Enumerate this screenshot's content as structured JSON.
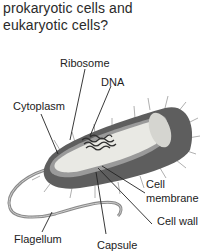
{
  "question": {
    "line1": "prokaryotic cells and",
    "line2": "eukaryotic cells?"
  },
  "diagram": {
    "labels": {
      "ribosome": "Ribosome",
      "dna": "DNA",
      "cytoplasm": "Cytoplasm",
      "cell_membrane_1": "Cell",
      "cell_membrane_2": "membrane",
      "cell_wall": "Cell wall",
      "flagellum": "Flagellum",
      "capsule": "Capsule"
    }
  }
}
